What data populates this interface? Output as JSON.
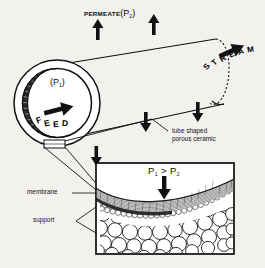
{
  "figure": {
    "type": "technical-diagram",
    "background_color": "#f2f1ee",
    "ink_color": "#0d0d0d"
  },
  "top_diagram": {
    "permeate_label": "PERMEATE",
    "permeate_pressure_open": "(",
    "permeate_pressure_symbol": "P",
    "permeate_pressure_sub": "2",
    "permeate_pressure_close": ")",
    "feed_pressure_open": "(",
    "feed_pressure_symbol": "P",
    "feed_pressure_sub": "1",
    "feed_pressure_close": ")",
    "feed_label": "FEED",
    "stream_label": "STREAM",
    "stream_letters": [
      "S",
      "T",
      "R",
      "E",
      "A",
      "M"
    ],
    "tube_label_line1": "tube shaped",
    "tube_label_line2": "porous ceramic",
    "permeate_arrow_count": 2,
    "permeate_out_arrow_count": 3,
    "arrow_direction_permeate": "up",
    "arrow_direction_outflow": "down",
    "arrow_direction_feed": "right"
  },
  "detail_panel": {
    "pressure_inequality_left": "P",
    "pressure_inequality_left_sub": "1",
    "pressure_inequality_operator": ">",
    "pressure_inequality_right": "P",
    "pressure_inequality_right_sub": "2",
    "flow_arrow_direction": "down",
    "layer_labels": [
      {
        "name": "membrane",
        "description": "thin fine-pored selective skin layer"
      },
      {
        "name": "support",
        "description": "coarse large-grained porous substrate"
      }
    ],
    "membrane_label": "membrane",
    "support_label": "support"
  }
}
